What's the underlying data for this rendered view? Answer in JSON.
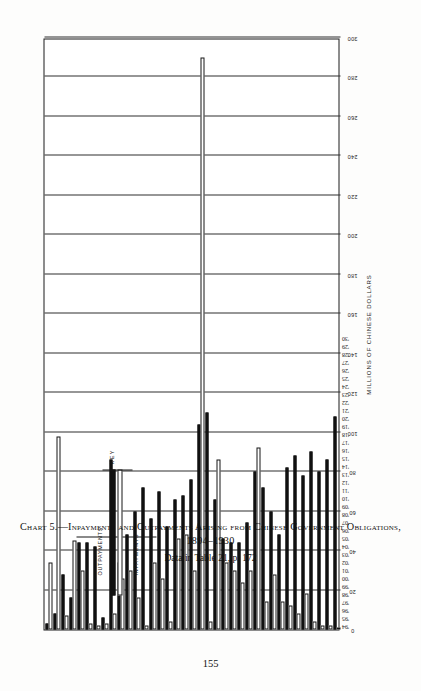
{
  "page": {
    "number": "155"
  },
  "caption": {
    "main": "Chart 5.—Inpayments and Outpayments Arising from Chinese Government Obligations, 1894–1930",
    "sub": "Data in Table 21, p. 172"
  },
  "key": {
    "title": "KEY",
    "outpayments_label": "OUTPAYMENTS",
    "inpayments_label": "INPAYMENTS"
  },
  "axes": {
    "value_axis_title": "MILLIONS OF CHINESE DOLLARS",
    "value_ticks": [
      "0",
      "20",
      "40",
      "60",
      "80",
      "100",
      "120",
      "140",
      "160",
      "180",
      "200",
      "220",
      "240",
      "260",
      "280",
      "300"
    ]
  },
  "colors": {
    "outpayments": "#111111",
    "inpayments": "#ffffff",
    "ink": "#1a1a1a",
    "paper": "#fdfdfc"
  },
  "chart_data": {
    "type": "bar",
    "orientation": "horizontal",
    "title": "Chart 5.—Inpayments and Outpayments Arising from Chinese Government Obligations, 1894–1930",
    "subtitle": "Data in Table 21, p. 172",
    "xlabel": "MILLIONS OF CHINESE DOLLARS",
    "ylabel": "",
    "xlim": [
      0,
      300
    ],
    "grid": true,
    "legend_position": "top-left key box",
    "categories": [
      "'94",
      "'95",
      "'96",
      "'97",
      "'98",
      "'99",
      "'00",
      "'01",
      "'02",
      "'03",
      "'04",
      "'05",
      "'06",
      "'07",
      "'08",
      "'09",
      "'10",
      "'11",
      "'12",
      "'13",
      "'14",
      "'15",
      "'16",
      "'17",
      "'18",
      "'19",
      "'20",
      "'21",
      "'22",
      "'23",
      "'24",
      "'25",
      "'26",
      "'27",
      "'28",
      "'29",
      "'30"
    ],
    "series": [
      {
        "name": "INPAYMENTS",
        "values": [
          34,
          98,
          7,
          45,
          30,
          3,
          2,
          3,
          8,
          26,
          30,
          16,
          2,
          34,
          26,
          4,
          46,
          48,
          30,
          290,
          4,
          86,
          34,
          30,
          24,
          30,
          92,
          14,
          28,
          14,
          12,
          8,
          18,
          4,
          2,
          2,
          0
        ]
      },
      {
        "name": "OUTPAYMENTS",
        "values": [
          3,
          8,
          28,
          16,
          44,
          44,
          42,
          6,
          86,
          34,
          48,
          60,
          72,
          56,
          70,
          52,
          66,
          68,
          76,
          104,
          110,
          66,
          46,
          44,
          44,
          54,
          80,
          72,
          60,
          48,
          82,
          88,
          78,
          90,
          80,
          86,
          108
        ]
      }
    ]
  }
}
